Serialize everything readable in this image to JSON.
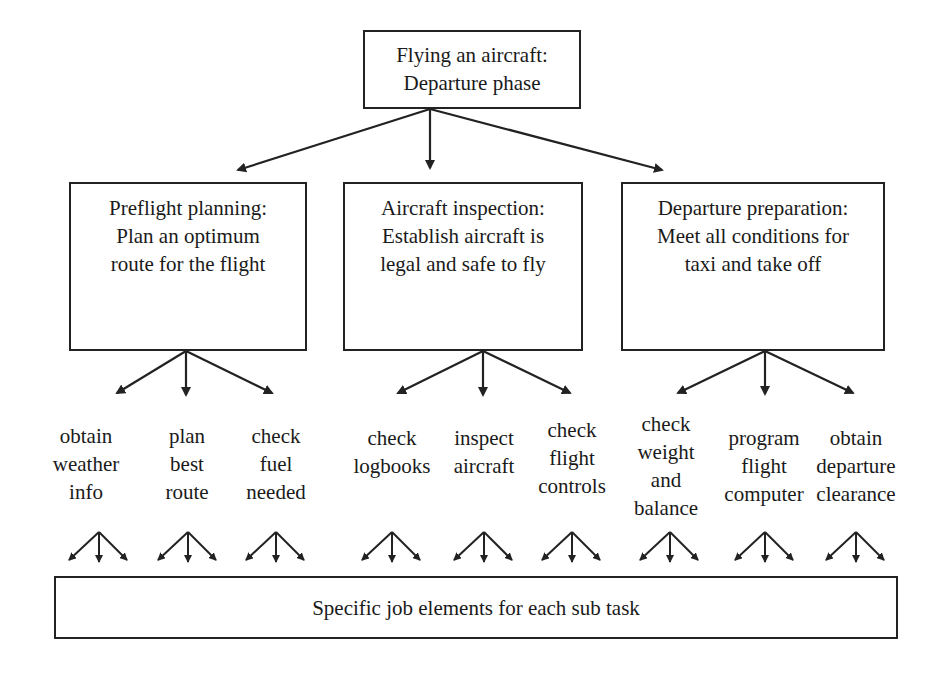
{
  "root": {
    "title": "Flying an aircraft:",
    "subtitle": "Departure phase"
  },
  "tasks": [
    {
      "label": "Preflight planning:\nPlan an optimum\nroute for the flight",
      "subtasks": [
        "obtain\nweather\ninfo",
        "plan\nbest\nroute",
        "check\nfuel\nneeded"
      ]
    },
    {
      "label": "Aircraft inspection:\nEstablish aircraft is\nlegal and safe to fly",
      "subtasks": [
        "check\nlogbooks",
        "inspect\naircraft",
        "check\nflight\ncontrols"
      ]
    },
    {
      "label": "Departure preparation:\nMeet all conditions for\ntaxi and take off",
      "subtasks": [
        "check\nweight\nand\nbalance",
        "program\nflight\ncomputer",
        "obtain\ndeparture\nclearance"
      ]
    }
  ],
  "footer": {
    "label": "Specific job elements for each sub task"
  },
  "colors": {
    "line": "#222222",
    "background": "#ffffff"
  }
}
